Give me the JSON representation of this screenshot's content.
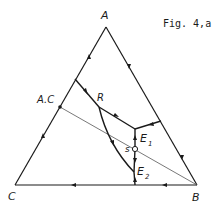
{
  "figure": {
    "caption": "Fig. 4,a",
    "stroke_color": "#1a1a1a",
    "thin_line_color": "#555555",
    "background": "#ffffff"
  },
  "labels": {
    "vertex_a": "A",
    "vertex_b": "B",
    "vertex_c": "C",
    "point_ac": "A.C",
    "point_r": "R",
    "point_e1": "E",
    "point_e1_sub": "1",
    "point_e2": "E",
    "point_e2_sub": "2",
    "point_s": "s"
  },
  "diagram": {
    "type": "ternary phase diagram",
    "vertices": {
      "A": [
        106,
        27
      ],
      "B": [
        197,
        185
      ],
      "C": [
        15,
        185
      ]
    },
    "points": {
      "AC": [
        60,
        107
      ],
      "left_edge_start": [
        75,
        79
      ],
      "R": [
        99,
        107
      ],
      "E1": [
        135,
        129
      ],
      "right_edge_point": [
        161,
        121
      ],
      "s": [
        135,
        149
      ],
      "E2": [
        134,
        172
      ],
      "base_point": [
        135,
        185
      ]
    },
    "lines": [
      {
        "from": "left_edge_start",
        "to": "R",
        "arrow": "toward R"
      },
      {
        "from": "R",
        "to": "E1",
        "arrow": "toward E1"
      },
      {
        "from": "right_edge_point",
        "to": "E1",
        "arrow": "toward E1"
      },
      {
        "from": "s",
        "to": "E1",
        "arrow": "toward E1"
      },
      {
        "from": "s",
        "to": "E2",
        "arrow": "toward E2"
      },
      {
        "from": "base_point",
        "to": "E2",
        "arrow": "toward E2"
      },
      {
        "from": "R",
        "to": "E2",
        "curve": true,
        "arrow": "toward E2"
      },
      {
        "from": "AC",
        "to": "B",
        "thin": true
      }
    ]
  }
}
